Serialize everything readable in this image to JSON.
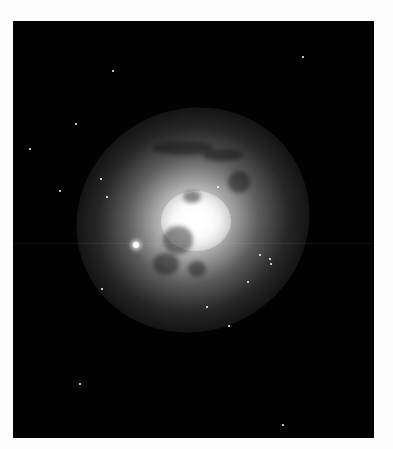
{
  "image": {
    "subject": "elliptical-spiral galaxy with dust lanes",
    "background_color": "#ffffff",
    "frame_color": "#020202",
    "core_color": "#ffffff"
  },
  "stars": [
    {
      "x": 123,
      "y": 224,
      "r": 3,
      "bright": true
    },
    {
      "x": 100,
      "y": 50,
      "r": 1
    },
    {
      "x": 290,
      "y": 36,
      "r": 1
    },
    {
      "x": 63,
      "y": 103,
      "r": 1
    },
    {
      "x": 17,
      "y": 128,
      "r": 1
    },
    {
      "x": 88,
      "y": 158,
      "r": 1
    },
    {
      "x": 94,
      "y": 176,
      "r": 1
    },
    {
      "x": 247,
      "y": 234,
      "r": 1
    },
    {
      "x": 257,
      "y": 238,
      "r": 1
    },
    {
      "x": 235,
      "y": 261,
      "r": 1
    },
    {
      "x": 258,
      "y": 243,
      "r": 1
    },
    {
      "x": 89,
      "y": 268,
      "r": 1
    },
    {
      "x": 194,
      "y": 286,
      "r": 1
    },
    {
      "x": 216,
      "y": 305,
      "r": 1
    },
    {
      "x": 270,
      "y": 404,
      "r": 1
    },
    {
      "x": 205,
      "y": 166,
      "r": 1
    },
    {
      "x": 47,
      "y": 170,
      "r": 1
    },
    {
      "x": 67,
      "y": 363,
      "r": 1
    }
  ]
}
